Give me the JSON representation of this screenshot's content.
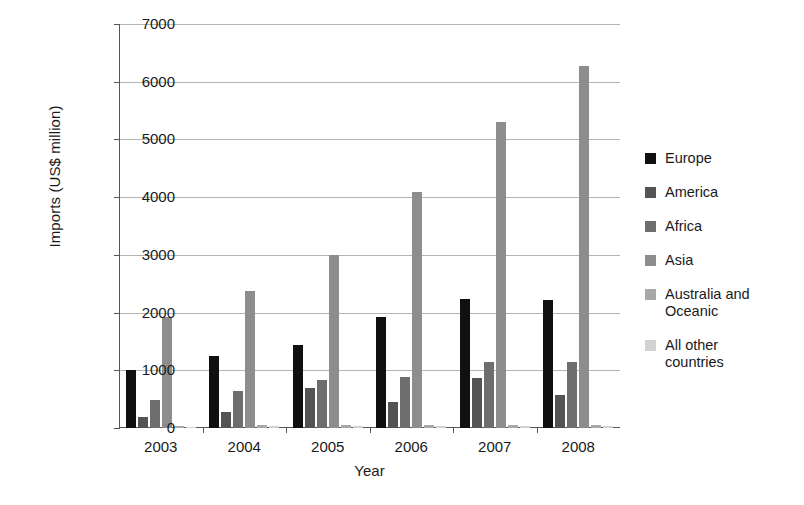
{
  "chart_data": {
    "type": "bar",
    "title": "",
    "xlabel": "Year",
    "ylabel": "Imports (US$ million)",
    "categories": [
      "2003",
      "2004",
      "2005",
      "2006",
      "2007",
      "2008"
    ],
    "ylim": [
      0,
      7000
    ],
    "ytick_values": [
      0,
      1000,
      2000,
      3000,
      4000,
      5000,
      6000,
      7000
    ],
    "ytick_labels": [
      "0",
      "1000",
      "2000",
      "3000",
      "4000",
      "5000",
      "6000",
      "7000"
    ],
    "grid": true,
    "legend_position": "right",
    "series": [
      {
        "name": "Europe",
        "color": "#101010",
        "values": [
          1000,
          1240,
          1430,
          1930,
          2240,
          2210
        ]
      },
      {
        "name": "America",
        "color": "#545454",
        "values": [
          195,
          270,
          700,
          450,
          860,
          580
        ]
      },
      {
        "name": "Africa",
        "color": "#6e6e6e",
        "values": [
          480,
          640,
          840,
          890,
          1140,
          1150
        ]
      },
      {
        "name": "Asia",
        "color": "#8d8d8d",
        "values": [
          1930,
          2380,
          3000,
          4090,
          5310,
          6280
        ]
      },
      {
        "name": "Australia and\nOceanic",
        "color": "#a8a8a8",
        "values": [
          40,
          45,
          45,
          50,
          55,
          60
        ]
      },
      {
        "name": "All other\ncountries",
        "color": "#d2d2d2",
        "values": [
          25,
          30,
          30,
          35,
          35,
          40
        ]
      }
    ]
  },
  "caption": {
    "text": ""
  }
}
